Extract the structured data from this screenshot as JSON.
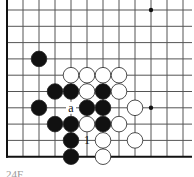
{
  "diagram": {
    "type": "go-board-fragment",
    "grid": {
      "origin_x": 7,
      "origin_y": 10,
      "step_x": 16,
      "step_y": 16.3,
      "cols": 12,
      "rows": 10,
      "right_edge_x": 192,
      "line_color": "#555555",
      "edge_color": "#111111",
      "left_edge": true,
      "bottom_edge": true
    },
    "star_points": [
      [
        9,
        0
      ],
      [
        2,
        6
      ],
      [
        9,
        6
      ]
    ],
    "black_stones": [
      [
        2,
        3
      ],
      [
        3,
        5
      ],
      [
        4,
        5
      ],
      [
        6,
        5
      ],
      [
        2,
        6
      ],
      [
        5,
        6
      ],
      [
        6,
        6
      ],
      [
        3,
        7
      ],
      [
        4,
        7
      ],
      [
        6,
        7
      ],
      [
        4,
        8
      ],
      [
        4,
        9
      ]
    ],
    "white_stones": [
      [
        4,
        4
      ],
      [
        5,
        4
      ],
      [
        6,
        4
      ],
      [
        7,
        4
      ],
      [
        5,
        5
      ],
      [
        7,
        5
      ],
      [
        8,
        6
      ],
      [
        5,
        7
      ],
      [
        7,
        7
      ],
      [
        6,
        8
      ],
      [
        8,
        8
      ],
      [
        6,
        9
      ]
    ],
    "labels": [
      {
        "col": 4,
        "row": 6,
        "text": "a",
        "on": "empty"
      },
      {
        "col": 5,
        "row": 8,
        "text": "1",
        "on": "white"
      }
    ],
    "colors": {
      "black": "#111111",
      "white": "#ffffff",
      "stroke": "#222222"
    },
    "caption": "24F"
  }
}
